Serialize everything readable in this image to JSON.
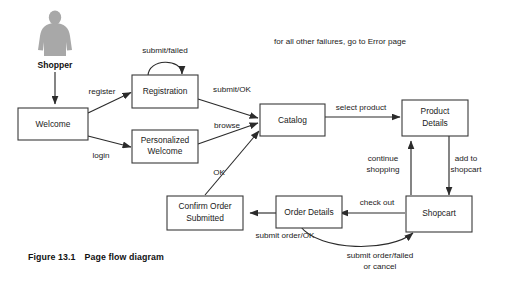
{
  "figure": {
    "caption_number": "Figure 13.1",
    "caption_title": "Page flow diagram",
    "note": "for all other failures, go to Error page"
  },
  "actor": {
    "label": "Shopper",
    "icon": "person-icon",
    "color": "#a8a8a8"
  },
  "colors": {
    "box_border": "#3a3a3a",
    "edge": "#2b2b2b",
    "text": "#1a1a1a",
    "background": "#ffffff",
    "actor": "#a8a8a8"
  },
  "nodes": [
    {
      "id": "welcome",
      "label": "Welcome",
      "line1": "Welcome",
      "line2": ""
    },
    {
      "id": "registration",
      "label": "Registration",
      "line1": "Registration",
      "line2": ""
    },
    {
      "id": "personalized",
      "label": "Personalized Welcome",
      "line1": "Personalized",
      "line2": "Welcome"
    },
    {
      "id": "catalog",
      "label": "Catalog",
      "line1": "Catalog",
      "line2": ""
    },
    {
      "id": "product",
      "label": "Product Details",
      "line1": "Product",
      "line2": "Details"
    },
    {
      "id": "shopcart",
      "label": "Shopcart",
      "line1": "Shopcart",
      "line2": ""
    },
    {
      "id": "orderdetails",
      "label": "Order Details",
      "line1": "Order Details",
      "line2": ""
    },
    {
      "id": "confirm",
      "label": "Confirm Order Submitted",
      "line1": "Confirm Order",
      "line2": "Submitted"
    }
  ],
  "edges": [
    {
      "id": "shopper-welcome",
      "from": "Shopper",
      "to": "Welcome",
      "label": ""
    },
    {
      "id": "welcome-registration",
      "from": "Welcome",
      "to": "Registration",
      "label": "register"
    },
    {
      "id": "welcome-personalized",
      "from": "Welcome",
      "to": "Personalized Welcome",
      "label": "login"
    },
    {
      "id": "registration-self",
      "from": "Registration",
      "to": "Registration",
      "label": "submit/failed"
    },
    {
      "id": "registration-catalog",
      "from": "Registration",
      "to": "Catalog",
      "label": "submit/OK"
    },
    {
      "id": "personalized-catalog",
      "from": "Personalized Welcome",
      "to": "Catalog",
      "label": "browse"
    },
    {
      "id": "confirm-catalog",
      "from": "Confirm Order Submitted",
      "to": "Catalog",
      "label": "OK"
    },
    {
      "id": "catalog-product",
      "from": "Catalog",
      "to": "Product Details",
      "label": "select product"
    },
    {
      "id": "product-shopcart",
      "from": "Product Details",
      "to": "Shopcart",
      "label_line1": "add to",
      "label_line2": "shopcart"
    },
    {
      "id": "shopcart-product",
      "from": "Shopcart",
      "to": "Product Details",
      "label_line1": "continue",
      "label_line2": "shopping"
    },
    {
      "id": "shopcart-orderdetails",
      "from": "Shopcart",
      "to": "Order Details",
      "label": "check out"
    },
    {
      "id": "orderdetails-confirm",
      "from": "Order Details",
      "to": "Confirm Order Submitted",
      "label": "submit order/OK"
    },
    {
      "id": "orderdetails-shopcart",
      "from": "Order Details",
      "to": "Shopcart",
      "label_line1": "submit order/failed",
      "label_line2": "or cancel"
    }
  ]
}
